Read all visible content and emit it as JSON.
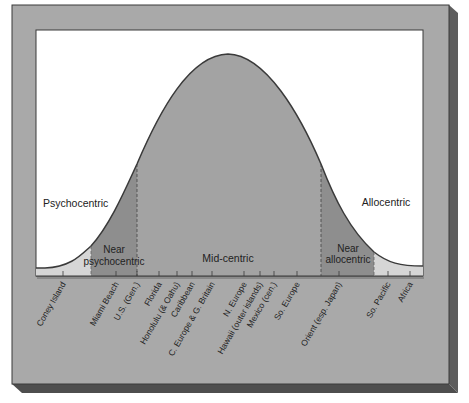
{
  "diagram": {
    "type": "bell-curve-distribution",
    "segments": [
      {
        "id": "psychocentric",
        "label": "Psychocentric"
      },
      {
        "id": "near-psychocentric",
        "label_line1": "Near",
        "label_line2": "psychocentric"
      },
      {
        "id": "mid-centric",
        "label": "Mid-centric"
      },
      {
        "id": "near-allocentric",
        "label_line1": "Near",
        "label_line2": "allocentric"
      },
      {
        "id": "allocentric",
        "label": "Allocentric"
      }
    ],
    "destinations": [
      {
        "label": "Coney Island",
        "x": 63
      },
      {
        "label": "Miami Beach",
        "x": 116
      },
      {
        "label": "U.S. (Gen.)",
        "x": 137
      },
      {
        "label": "Florida",
        "x": 159
      },
      {
        "label": "Honolulu (& Oahu)",
        "x": 177
      },
      {
        "label": "Caribbean",
        "x": 192
      },
      {
        "label": "C. Europe & G. Britain",
        "x": 212
      },
      {
        "label": "N. Europe",
        "x": 244
      },
      {
        "label": "Hawaii (outer islands)",
        "x": 260
      },
      {
        "label": "Mexico (cen.)",
        "x": 274
      },
      {
        "label": "So. Europe",
        "x": 297
      },
      {
        "label": "Orient (esp. Japan)",
        "x": 339
      },
      {
        "label": "So. Pacific",
        "x": 388
      },
      {
        "label": "Africa",
        "x": 410
      }
    ],
    "colors": {
      "frame": "#a9a9a9",
      "frame_shadow": "#555555",
      "plot_bg": "#ffffff",
      "mid": "#a3a3a3",
      "near": "#8e8e8e",
      "tail": "#d6d6d6",
      "line": "#3a3a3a"
    }
  }
}
